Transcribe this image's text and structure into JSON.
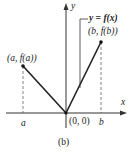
{
  "figure": {
    "caption": "(b)",
    "function_label": "y = f(x)",
    "axis_x_label": "x",
    "axis_y_label": "y",
    "point_left_label": "(a, f(a))",
    "point_right_label": "(b, f(b))",
    "origin_label": "(0, 0)",
    "tick_a_label": "a",
    "tick_b_label": "b",
    "line_color": "#222222",
    "dash_color": "#666666"
  }
}
